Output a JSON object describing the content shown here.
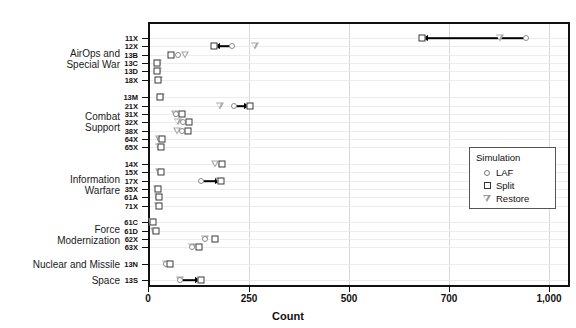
{
  "chart_data": {
    "type": "scatter",
    "title": "",
    "xlabel": "Count",
    "ylabel": "",
    "grid": true,
    "legend_position": "right-middle",
    "xlim": [
      0,
      1000
    ],
    "xticks": [
      {
        "label": "0",
        "value": 0,
        "px": 148
      },
      {
        "label": "250",
        "value": 250,
        "px": 249
      },
      {
        "label": "500",
        "value": 500,
        "px": 349
      },
      {
        "label": "700",
        "value": 700,
        "px": 449
      },
      {
        "label": "1,000",
        "value": 1000,
        "px": 549
      }
    ],
    "legend": {
      "title": "Simulation",
      "entries": [
        {
          "name": "LAF",
          "marker": "circle"
        },
        {
          "name": "Split",
          "marker": "square"
        },
        {
          "name": "Restore",
          "marker": "triangle-down"
        }
      ]
    },
    "series": [
      {
        "name": "LAF",
        "marker": "circle"
      },
      {
        "name": "Split",
        "marker": "square"
      },
      {
        "name": "Restore",
        "marker": "triangle-down"
      }
    ],
    "groups": [
      {
        "label": "AirOps and\nSpecial War",
        "label_line1": "AirOps and",
        "label_line2": "Special War",
        "categories": [
          "11X",
          "12X",
          "13B",
          "13C",
          "13D",
          "18X"
        ]
      },
      {
        "label": "Combat\nSupport",
        "label_line1": "Combat",
        "label_line2": "Support",
        "categories": [
          "13M",
          "21X",
          "31X",
          "32X",
          "38X",
          "64X",
          "65X"
        ]
      },
      {
        "label": "Information\nWarfare",
        "label_line1": "Information",
        "label_line2": "Warfare",
        "categories": [
          "14X",
          "15X",
          "17X",
          "35X",
          "61A",
          "71X"
        ]
      },
      {
        "label": "Force\nModernization",
        "label_line1": "Force",
        "label_line2": "Modernization",
        "categories": [
          "61C",
          "61D",
          "62X",
          "63X"
        ]
      },
      {
        "label": "Nuclear and Missile",
        "label_line1": "Nuclear and Missile",
        "label_line2": "",
        "categories": [
          "13N"
        ]
      },
      {
        "label": "Space",
        "label_line1": "Space",
        "label_line2": "",
        "categories": [
          "13S"
        ]
      }
    ],
    "rows": [
      {
        "category": "11X",
        "y": 38,
        "LAF": 930,
        "Split": 645,
        "Restore": 852,
        "arrow": {
          "from": "LAF",
          "to": "Split",
          "dir": "left"
        }
      },
      {
        "category": "12X",
        "y": 46,
        "LAF": 208,
        "Split": 163,
        "Restore": 265,
        "arrow": {
          "from": "LAF",
          "to": "Split",
          "dir": "left"
        }
      },
      {
        "category": "13B",
        "y": 55,
        "LAF": 74,
        "Split": 57,
        "Restore": 92
      },
      {
        "category": "13C",
        "y": 63,
        "LAF": 24,
        "Split": 22,
        "Restore": 24
      },
      {
        "category": "13D",
        "y": 71,
        "LAF": 25,
        "Split": 23,
        "Restore": 25
      },
      {
        "category": "18X",
        "y": 80,
        "LAF": 26,
        "Split": 24,
        "Restore": 26
      },
      {
        "category": "13M",
        "y": 97,
        "LAF": 31,
        "Split": 29,
        "Restore": 31
      },
      {
        "category": "21X",
        "y": 106,
        "LAF": 212,
        "Split": 253,
        "Restore": 178,
        "arrow": {
          "from": "LAF",
          "to": "Split",
          "dir": "right"
        }
      },
      {
        "category": "31X",
        "y": 114,
        "LAF": 70,
        "Split": 84,
        "Restore": 68
      },
      {
        "category": "32X",
        "y": 122,
        "LAF": 86,
        "Split": 101,
        "Restore": 74
      },
      {
        "category": "38X",
        "y": 131,
        "LAF": 85,
        "Split": 100,
        "Restore": 73
      },
      {
        "category": "64X",
        "y": 139,
        "LAF": 30,
        "Split": 35,
        "Restore": 28
      },
      {
        "category": "65X",
        "y": 147,
        "LAF": 29,
        "Split": 33,
        "Restore": 27
      },
      {
        "category": "14X",
        "y": 164,
        "LAF": 180,
        "Split": 183,
        "Restore": 167
      },
      {
        "category": "15X",
        "y": 172,
        "LAF": 30,
        "Split": 32,
        "Restore": 28
      },
      {
        "category": "17X",
        "y": 181,
        "LAF": 130,
        "Split": 180,
        "Restore": 176,
        "arrow": {
          "from": "LAF",
          "to": "Split",
          "dir": "right"
        }
      },
      {
        "category": "35X",
        "y": 189,
        "LAF": 24,
        "Split": 25,
        "Restore": 23
      },
      {
        "category": "61A",
        "y": 197,
        "LAF": 25,
        "Split": 26,
        "Restore": 24
      },
      {
        "category": "71X",
        "y": 206,
        "LAF": 26,
        "Split": 27,
        "Restore": 25
      },
      {
        "category": "61C",
        "y": 222,
        "LAF": 11,
        "Split": 13,
        "Restore": 10
      },
      {
        "category": "61D",
        "y": 231,
        "LAF": 17,
        "Split": 20,
        "Restore": 16
      },
      {
        "category": "62X",
        "y": 239,
        "LAF": 142,
        "Split": 167,
        "Restore": 140
      },
      {
        "category": "63X",
        "y": 247,
        "LAF": 110,
        "Split": 125,
        "Restore": 108
      },
      {
        "category": "13N",
        "y": 264,
        "LAF": 45,
        "Split": 55,
        "Restore": 44
      },
      {
        "category": "13S",
        "y": 280,
        "LAF": 80,
        "Split": 130,
        "Restore": 80,
        "arrow": {
          "from": "LAF",
          "to": "Split",
          "dir": "right"
        }
      }
    ]
  }
}
